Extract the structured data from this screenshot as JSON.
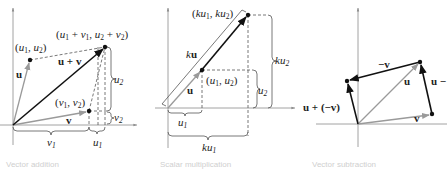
{
  "panels": [
    {
      "id": "vector-addition",
      "caption": "Vector addition",
      "labels": {
        "point_u": "(u1, u2)",
        "point_sum": "(u1 + v1, u2 + v2)",
        "point_v": "(v1, v2)",
        "vec_u": "u",
        "vec_v": "v",
        "vec_sum": "u + v",
        "brace_v1": "v1",
        "brace_u1": "u1",
        "brace_u2": "u2",
        "brace_v2": "v2"
      }
    },
    {
      "id": "scalar-multiplication",
      "caption": "Scalar multiplication",
      "labels": {
        "point_ku": "(ku1, ku2)",
        "point_u": "(u1, u2)",
        "vec_ku": "ku",
        "vec_u": "u",
        "brace_u1": "u1",
        "brace_ku1": "ku1",
        "brace_u2": "u2",
        "brace_ku2": "ku2"
      }
    },
    {
      "id": "vector-subtraction",
      "caption": "Vector subtraction",
      "labels": {
        "vec_neg_v": "−v",
        "vec_u": "u",
        "vec_u_minus": "u −",
        "vec_u_plus_neg_v": "u + (−v)",
        "vec_v": "v"
      }
    }
  ],
  "colors": {
    "axis": "#8a8a8a",
    "gray_vector": "#9a9a9a",
    "black_vector": "#111111",
    "dashed": "#555555",
    "text": "#222222"
  }
}
